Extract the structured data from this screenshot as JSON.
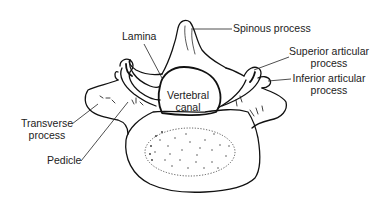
{
  "diagram": {
    "labels": {
      "spinous": "Spinous process",
      "lamina": "Lamina",
      "superior_line1": "Superior articular",
      "superior_line2": "process",
      "inferior_line1": "Inferior articular",
      "inferior_line2": "process",
      "canal_line1": "Vertebral",
      "canal_line2": "canal",
      "transverse_line1": "Transverse",
      "transverse_line2": "process",
      "pedicle": "Pedicle"
    },
    "colors": {
      "ink": "#111111",
      "text": "#222222",
      "background": "#ffffff"
    }
  }
}
